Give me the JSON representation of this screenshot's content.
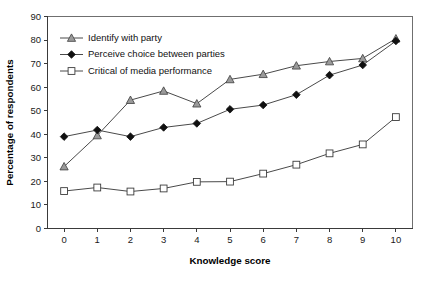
{
  "chart_data": {
    "type": "line",
    "title": "",
    "xlabel": "Knowledge score",
    "ylabel": "Percentage of respondents",
    "x": [
      0,
      1,
      2,
      3,
      4,
      5,
      6,
      7,
      8,
      9,
      10
    ],
    "xticklabels": [
      "0",
      "1",
      "2",
      "3",
      "4",
      "5",
      "6",
      "7",
      "8",
      "9",
      "10"
    ],
    "yticklabels": [
      "0",
      "10",
      "20",
      "30",
      "40",
      "50",
      "60",
      "70",
      "80",
      "90"
    ],
    "yticks": [
      0,
      10,
      20,
      30,
      40,
      50,
      60,
      70,
      80,
      90
    ],
    "xlim": [
      -0.5,
      10.5
    ],
    "ylim": [
      0,
      90
    ],
    "grid": false,
    "legend_position": "upper-left",
    "series": [
      {
        "name": "Identify with party",
        "marker": "triangle",
        "values": [
          26.3,
          39.5,
          54.5,
          58.4,
          53.0,
          63.3,
          65.5,
          69.1,
          70.9,
          72.2,
          80.6
        ]
      },
      {
        "name": "Perceive choice between parties",
        "marker": "diamond",
        "values": [
          39.0,
          41.8,
          39.0,
          42.9,
          44.6,
          50.6,
          52.4,
          56.8,
          65.1,
          69.4,
          79.6
        ]
      },
      {
        "name": "Critical of media performance",
        "marker": "square",
        "values": [
          15.9,
          17.4,
          15.7,
          17.0,
          19.8,
          19.9,
          23.3,
          27.1,
          31.9,
          35.7,
          47.3
        ]
      }
    ]
  },
  "colors": {
    "axis": "#3a3a3a",
    "frame": "#6f6f6f",
    "line": "#4a4a4a",
    "triangle_fill": "#9a9a9a",
    "diamond_fill": "#101010",
    "square_fill": "#ffffff",
    "background": "#ffffff"
  }
}
